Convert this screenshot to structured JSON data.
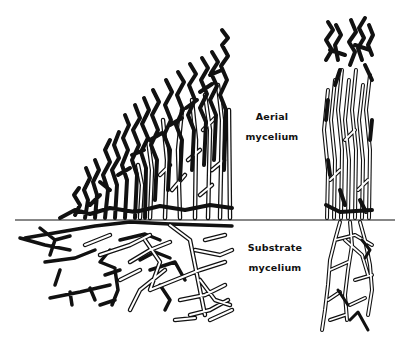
{
  "diagram": {
    "labels": {
      "aerial_line1": "Aerial",
      "aerial_line2": "mycelium",
      "substrate_line1": "Substrate",
      "substrate_line2": "mycelium"
    },
    "colors": {
      "ink": "#111111",
      "background": "#ffffff"
    },
    "panels": [
      {
        "name": "colony-cross-section",
        "description": "Fan-shaped colony edge showing dense dark aerial hyphae above and branching substrate hyphae below the surface line"
      },
      {
        "name": "colony-column",
        "description": "Vertical column section of mature colony with aerial hyphae above and substrate hyphae below"
      }
    ]
  }
}
